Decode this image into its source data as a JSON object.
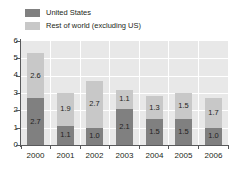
{
  "chart_data": {
    "type": "bar",
    "stacked": true,
    "title": "",
    "subtitle": "",
    "xlabel": "",
    "ylabel": "",
    "categories": [
      "2000",
      "2001",
      "2002",
      "2003",
      "2004",
      "2005",
      "2006"
    ],
    "series": [
      {
        "name": "United States",
        "color": "#808080",
        "values": [
          2.7,
          1.1,
          1.0,
          2.1,
          1.5,
          1.5,
          1.0
        ],
        "labels": [
          "2.7",
          "1.1",
          "1.0",
          "2.1",
          "1.5",
          "1.5",
          "1.0"
        ]
      },
      {
        "name": "Rest of world (excluding US)",
        "color": "#c8c8c8",
        "values": [
          2.6,
          1.9,
          2.7,
          1.1,
          1.3,
          1.5,
          1.7
        ],
        "labels": [
          "2.6",
          "1.9",
          "2.7",
          "1.1",
          "1.3",
          "1.5",
          "1.7"
        ]
      }
    ],
    "totals": [
      5.3,
      3.0,
      3.7,
      3.2,
      2.8,
      3.0,
      2.7
    ],
    "ylim": [
      0,
      6
    ],
    "yticks": [
      "0",
      "1",
      "2",
      "3",
      "4",
      "5",
      "6"
    ],
    "grid": true,
    "grid_color": "#ffffff",
    "plot_background": "#e8e8e8",
    "legend_position": "top-left"
  },
  "legend": {
    "items": [
      {
        "label": "United States",
        "swatch": "us"
      },
      {
        "label": "Rest of world (excluding US)",
        "swatch": "row"
      }
    ]
  }
}
